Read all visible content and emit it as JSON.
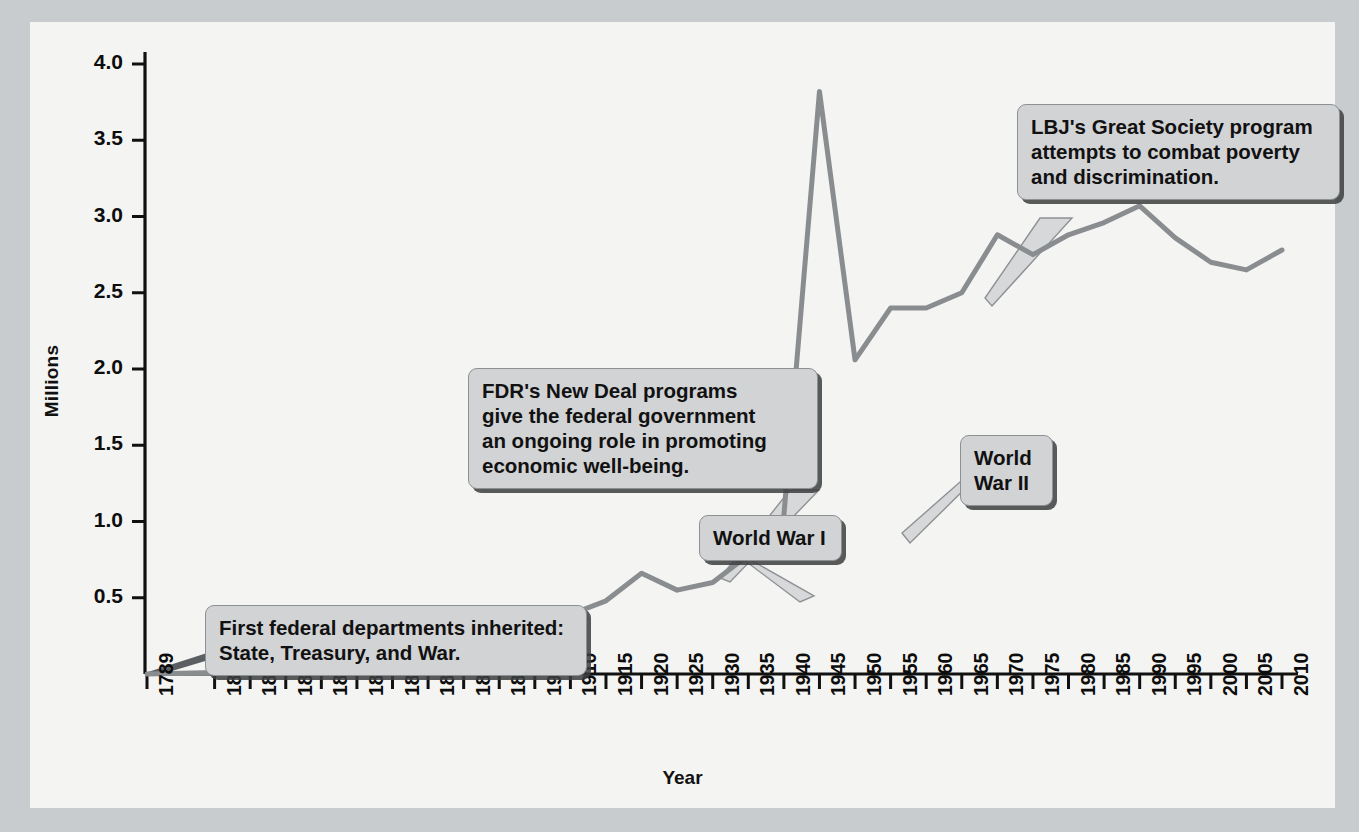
{
  "figure": {
    "background_color": "#f4f4f2",
    "page_border_color": "#c9ccce",
    "line_color": "#8a8d90",
    "callout_fill": "#d2d3d5",
    "callout_border": "#8e9194"
  },
  "chart_data": {
    "type": "line",
    "title": "",
    "xlabel": "Year",
    "ylabel": "Millions",
    "ylim": [
      0,
      4.0
    ],
    "ytick_labels": [
      "0.5",
      "1.0",
      "1.5",
      "2.0",
      "2.5",
      "3.0",
      "3.5",
      "4.0"
    ],
    "ytick_values": [
      0.5,
      1.0,
      1.5,
      2.0,
      2.5,
      3.0,
      3.5,
      4.0
    ],
    "grid": false,
    "legend": "none",
    "categories": [
      "1789",
      "1816",
      "1821",
      "1831",
      "1841",
      "1851",
      "1861",
      "1871",
      "1881",
      "1891",
      "1901",
      "1910",
      "1915",
      "1920",
      "1925",
      "1930",
      "1935",
      "1940",
      "1945",
      "1950",
      "1955",
      "1960",
      "1965",
      "1970",
      "1975",
      "1980",
      "1985",
      "1990",
      "1995",
      "2000",
      "2005",
      "2010"
    ],
    "values": [
      0.0,
      0.01,
      0.01,
      0.02,
      0.02,
      0.03,
      0.04,
      0.05,
      0.1,
      0.16,
      0.24,
      0.39,
      0.48,
      0.66,
      0.55,
      0.6,
      0.78,
      1.04,
      3.82,
      2.06,
      2.4,
      2.4,
      2.5,
      2.88,
      2.75,
      2.88,
      2.96,
      3.07,
      2.86,
      2.7,
      2.65,
      2.78
    ],
    "annotations": [
      {
        "name": "first-federal-departments",
        "text": "First federal departments inherited:\nState, Treasury, and War.",
        "anchor_year": "1789",
        "anchor_value": 0.02
      },
      {
        "name": "fdr-new-deal",
        "text": "FDR's New Deal programs\ngive the federal government\nan ongoing role in promoting\neconomic well-being.",
        "anchor_year": "1933",
        "anchor_value": 0.62
      },
      {
        "name": "world-war-one",
        "text": "World War I",
        "anchor_year": "1918",
        "anchor_value": 0.6
      },
      {
        "name": "world-war-two",
        "text": "World War II",
        "anchor_year": "1943",
        "anchor_value": 1.55
      },
      {
        "name": "lbj-great-society",
        "text": "LBJ's Great Society program\nattempts to combat poverty\nand discrimination.",
        "anchor_year": "1965",
        "anchor_value": 2.5
      }
    ]
  }
}
